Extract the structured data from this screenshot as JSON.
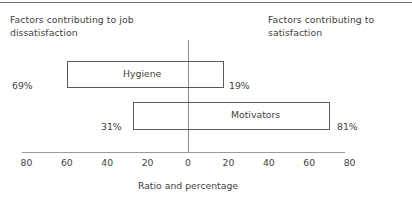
{
  "figure": {
    "caption_left": "Factors contributing to job dissatisfaction",
    "caption_right": "Factors contributing to satisfaction"
  },
  "chart_data": {
    "type": "bar",
    "orientation": "horizontal-diverging",
    "title": "",
    "xlabel": "Ratio and percentage",
    "ylabel": "",
    "xlim": [
      -88,
      88
    ],
    "grid": false,
    "legend": null,
    "zero_line": 0,
    "tick_labels": [
      "80",
      "60",
      "40",
      "20",
      "0",
      "20",
      "40",
      "60",
      "80"
    ],
    "tick_values": [
      -80,
      -60,
      -40,
      -20,
      0,
      20,
      40,
      60,
      80
    ],
    "categories": [
      "Hygiene",
      "Motivators"
    ],
    "series": [
      {
        "name": "Factors contributing to job dissatisfaction",
        "side": "left",
        "values": [
          69,
          31
        ],
        "value_labels": [
          "69%",
          "31%"
        ]
      },
      {
        "name": "Factors contributing to satisfaction",
        "side": "right",
        "values": [
          19,
          81
        ],
        "value_labels": [
          "19%",
          "81%"
        ]
      }
    ],
    "bars": [
      {
        "label": "Hygiene",
        "left_value": 69,
        "right_value": 19,
        "left_label": "69%",
        "right_label": "19%"
      },
      {
        "label": "Motivators",
        "left_value": 31,
        "right_value": 81,
        "left_label": "31%",
        "right_label": "81%"
      }
    ]
  },
  "colors": {
    "background": "#ffffff",
    "text": "#3f3f3f",
    "bar_outline": "#5a5a5a",
    "axis": "#9a9a9a",
    "zero_line": "#8a8a8a",
    "frame_rule": "#6e6e6e"
  }
}
